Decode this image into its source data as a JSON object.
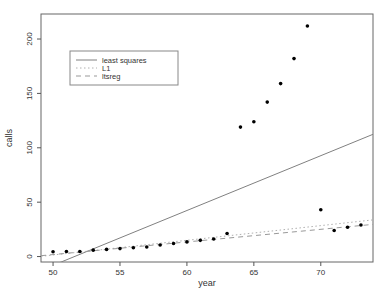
{
  "chart_data": {
    "type": "scatter",
    "title": "",
    "xlabel": "year",
    "ylabel": "calls",
    "xlim": [
      49.1,
      73.9
    ],
    "ylim": [
      -5,
      223
    ],
    "xticks": [
      50,
      55,
      60,
      65,
      70
    ],
    "yticks": [
      0,
      50,
      100,
      150,
      200
    ],
    "grid": false,
    "points": {
      "x": [
        50,
        51,
        52,
        53,
        54,
        55,
        56,
        57,
        58,
        59,
        60,
        61,
        62,
        63,
        64,
        65,
        66,
        67,
        68,
        69,
        70,
        71,
        72,
        73
      ],
      "y": [
        4.4,
        4.7,
        4.7,
        5.9,
        6.6,
        7.3,
        8.1,
        8.8,
        10.6,
        12.0,
        13.5,
        14.9,
        16.1,
        21.2,
        119.0,
        124.0,
        142.0,
        159.0,
        182.0,
        212.0,
        43.0,
        24.0,
        27.0,
        29.0
      ]
    },
    "lines": [
      {
        "name": "least squares",
        "style": "solid",
        "intercept": -260.06,
        "slope": 5.04
      },
      {
        "name": "L1",
        "style": "dotted",
        "intercept": -66.05,
        "slope": 1.35
      },
      {
        "name": "ltsreg",
        "style": "dashed",
        "intercept": -56.16,
        "slope": 1.16
      }
    ],
    "legend": {
      "position": "upper-left-inside"
    }
  },
  "colors": {
    "point": "#000000",
    "solid_line": "#808080",
    "dotted_line": "#b0b0b0",
    "dashed_line": "#999999",
    "frame": "#666666",
    "tick": "#555555",
    "legend_border": "#888888"
  }
}
